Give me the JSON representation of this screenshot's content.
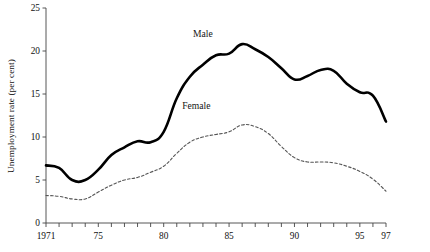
{
  "chart_data": {
    "type": "line",
    "title": "",
    "xlabel": "",
    "ylabel": "Unemployment rate (per cent)",
    "xlim": [
      1971,
      1997
    ],
    "ylim": [
      0,
      25
    ],
    "yticks": [
      0,
      5,
      10,
      15,
      20,
      25
    ],
    "ytick_labels": [
      "0",
      "5",
      "10",
      "15",
      "20",
      "25"
    ],
    "xticks": [
      1971,
      1972,
      1973,
      1974,
      1975,
      1976,
      1977,
      1978,
      1979,
      1980,
      1981,
      1982,
      1983,
      1984,
      1985,
      1986,
      1987,
      1988,
      1989,
      1990,
      1991,
      1992,
      1993,
      1994,
      1995,
      1996,
      1997
    ],
    "xtick_labels": [
      {
        "x": 1971,
        "label": "1971"
      },
      {
        "x": 1975,
        "label": "75"
      },
      {
        "x": 1980,
        "label": "80"
      },
      {
        "x": 1985,
        "label": "85"
      },
      {
        "x": 1990,
        "label": "90"
      },
      {
        "x": 1995,
        "label": "95"
      },
      {
        "x": 1997,
        "label": "97"
      }
    ],
    "grid": false,
    "legend_position": "inline-annotation",
    "x": [
      1971,
      1972,
      1973,
      1974,
      1975,
      1976,
      1977,
      1978,
      1979,
      1980,
      1981,
      1982,
      1983,
      1984,
      1985,
      1986,
      1987,
      1988,
      1989,
      1990,
      1991,
      1992,
      1993,
      1994,
      1995,
      1996,
      1997
    ],
    "series": [
      {
        "name": "Male",
        "style": "solid",
        "color": "#000000",
        "width": 2.6,
        "label_x": 1983.0,
        "label_y": 21.6,
        "values": [
          6.7,
          6.4,
          5.0,
          5.0,
          6.2,
          7.9,
          8.8,
          9.5,
          9.4,
          10.6,
          14.5,
          17.0,
          18.4,
          19.5,
          19.7,
          20.8,
          20.2,
          19.3,
          18.0,
          16.7,
          17.1,
          17.8,
          17.7,
          16.2,
          15.2,
          14.8,
          11.8
        ]
      },
      {
        "name": "Female",
        "style": "dashed",
        "color": "#555555",
        "width": 1.1,
        "label_x": 1982.5,
        "label_y": 13.2,
        "values": [
          3.2,
          3.1,
          2.8,
          2.8,
          3.6,
          4.4,
          5.0,
          5.3,
          5.9,
          6.6,
          8.1,
          9.4,
          10.0,
          10.3,
          10.6,
          11.4,
          11.2,
          10.4,
          8.9,
          7.6,
          7.1,
          7.1,
          7.0,
          6.6,
          6.0,
          5.1,
          3.7
        ]
      }
    ]
  }
}
